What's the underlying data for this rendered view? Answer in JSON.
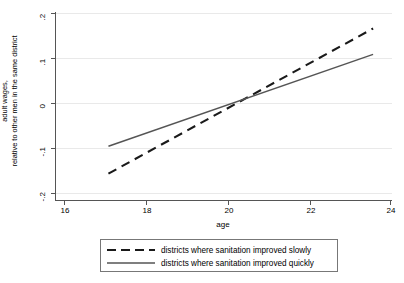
{
  "chart_data": {
    "type": "line",
    "title": "",
    "xlabel": "age",
    "ylabel_line1": "adult wages,",
    "ylabel_line2": "relative to other men in the same district",
    "xlim": [
      15.6,
      24.5
    ],
    "ylim": [
      -0.2,
      0.2
    ],
    "xticks": [
      16,
      18,
      20,
      22,
      24
    ],
    "xticklabels": [
      "16",
      "18",
      "20",
      "22",
      "24"
    ],
    "yticks": [
      -0.2,
      -0.1,
      0,
      0.1,
      0.2
    ],
    "yticklabels": [
      "-.2",
      "-.1",
      "0",
      ".1",
      ".2"
    ],
    "grid": "horizontal",
    "legend_position": "below-center",
    "series": [
      {
        "name": "districts where sanitation improved slowly",
        "style": "dashed",
        "color": "#1a1a1a",
        "x": [
          17,
          24
        ],
        "y": [
          -0.143,
          0.165
        ]
      },
      {
        "name": "districts where sanitation improved quickly",
        "style": "solid",
        "color": "#555555",
        "x": [
          17,
          24
        ],
        "y": [
          -0.085,
          0.11
        ]
      }
    ]
  },
  "axes": {
    "x_title": "age",
    "y_title_line1": "adult wages,",
    "y_title_line2": "relative to other men in the same district",
    "x_tick_labels": [
      "16",
      "18",
      "20",
      "22",
      "24"
    ],
    "y_tick_labels": [
      ".2",
      ".1",
      "0",
      "-.1",
      "-.2"
    ]
  },
  "legend": {
    "entries": [
      {
        "label": "districts where sanitation improved slowly",
        "key": "dashed-line-key"
      },
      {
        "label": "districts where sanitation improved quickly",
        "key": "solid-line-key"
      }
    ]
  },
  "colors": {
    "background": "#ffffff",
    "axis": "#555555",
    "grid": "#e8e8e8",
    "series_slowly": "#1a1a1a",
    "series_quickly": "#555555",
    "legend_border": "#777777"
  }
}
